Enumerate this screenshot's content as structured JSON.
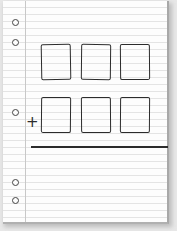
{
  "diagram": {
    "type": "addition-template",
    "rows": [
      {
        "label": "first-addend",
        "boxes": 3
      },
      {
        "label": "second-addend",
        "boxes": 3,
        "operator": "+"
      }
    ],
    "operator_symbol": "+",
    "holes": 4,
    "colors": {
      "paper": "#fdfdfd",
      "rule_lines": "#e4e4e4",
      "ink": "#2c2c2c",
      "margin": "#c8c8c8"
    }
  }
}
